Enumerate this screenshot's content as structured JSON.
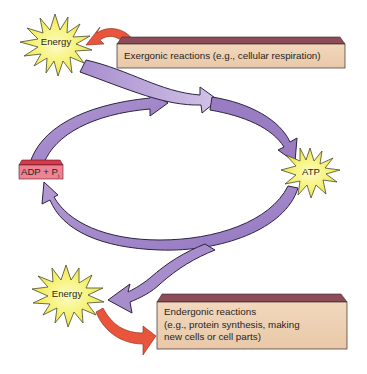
{
  "diagram": {
    "nodes": {
      "energy_top": {
        "label": "Energy"
      },
      "exergonic": {
        "label": "Exergonic reactions (e.g., cellular respiration)"
      },
      "adp": {
        "label": "ADP + P",
        "subscript": "i"
      },
      "atp": {
        "label": "ATP"
      },
      "energy_bottom": {
        "label": "Energy"
      },
      "endergonic": {
        "lines": [
          "Endergonic reactions",
          "(e.g., protein synthesis, making",
          "new cells or cell parts)"
        ]
      }
    },
    "edges": [
      {
        "from": "exergonic",
        "to": "energy_top",
        "style": "red-arrow"
      },
      {
        "from": "energy_top",
        "to": "atp",
        "style": "purple-arrow"
      },
      {
        "from": "adp",
        "to": "atp",
        "style": "purple-arrow"
      },
      {
        "from": "atp",
        "to": "adp",
        "style": "purple-arrow"
      },
      {
        "from": "atp",
        "to": "energy_bottom",
        "style": "purple-arrow"
      },
      {
        "from": "energy_bottom",
        "to": "endergonic",
        "style": "red-arrow"
      }
    ],
    "colors": {
      "starburst_fill": "#f4f05a",
      "starburst_center": "#fbfab0",
      "starburst_stroke": "#4a4a30",
      "box_fill": "#efd2b4",
      "box_top": "#8c4c5a",
      "adp_fill": "#ee8394",
      "adp_top": "#d83a4c",
      "arrow_purple": "#a98ccb",
      "arrow_purple_light": "#c9b6e2",
      "arrow_purple_dark": "#8263b0",
      "arrow_red": "#e8553c"
    }
  }
}
